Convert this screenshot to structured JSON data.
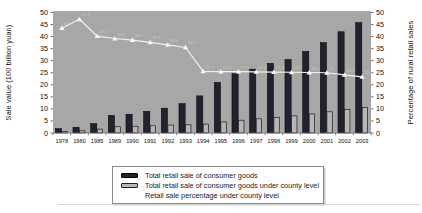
{
  "colors": {
    "plot_bg": "#a7a7a7",
    "dark_bar": "#23212f",
    "gray_bar": "#b6b6b6",
    "line": "#f3f3ea",
    "tick_text": "#111111"
  },
  "chart_data": {
    "type": "bar",
    "title": "",
    "categories": [
      "1978",
      "1980",
      "1985",
      "1989",
      "1990",
      "1991",
      "1992",
      "1993",
      "1994",
      "1995",
      "1996",
      "1997",
      "1998",
      "1999",
      "2000",
      "2001",
      "2002",
      "2003"
    ],
    "series": [
      {
        "name": "Total retail sale of consumer goods",
        "kind": "bar",
        "axis": "left",
        "color": "#23212f",
        "values": [
          1.8,
          2.4,
          3.9,
          7.3,
          7.8,
          9.0,
          10.3,
          12.2,
          15.4,
          21.0,
          24.6,
          26.5,
          28.9,
          30.5,
          33.9,
          37.5,
          42.0,
          45.8
        ]
      },
      {
        "name": "Total retail sale of consumer goods under county level",
        "kind": "bar",
        "axis": "left",
        "color": "#b6b6b6",
        "values": [
          0.6,
          0.9,
          1.6,
          2.6,
          2.8,
          3.0,
          3.3,
          3.4,
          3.7,
          4.6,
          5.3,
          5.9,
          6.5,
          7.1,
          7.9,
          8.8,
          9.7,
          10.6
        ]
      },
      {
        "name": "Retail sale percentage under county level",
        "kind": "line",
        "axis": "right",
        "color": "#f3f3ea",
        "values": [
          43.5,
          47.2,
          40.2,
          39.2,
          38.5,
          37.6,
          36.6,
          35.5,
          25.6,
          25.5,
          25.5,
          25.4,
          25.3,
          25.2,
          25.1,
          25.0,
          24.1,
          23.3
        ]
      }
    ],
    "xlabel": "",
    "ylabel_left": "Sale value (100 billion yuan)",
    "ylabel_right": "Percentage of rural retail sales",
    "ylim_left": [
      0,
      50
    ],
    "ylim_right": [
      0,
      50
    ],
    "ytick_step": 5,
    "grid": false,
    "legend_position": "bottom"
  }
}
